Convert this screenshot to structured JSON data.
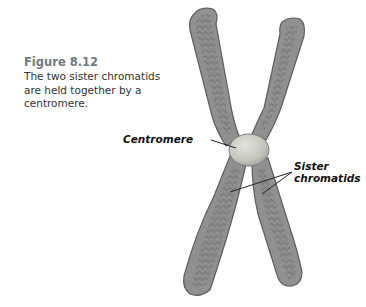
{
  "figure": {
    "number": "Figure 8.12",
    "caption_lines": [
      "The two sister chromatids",
      "are held together by a",
      "centromere."
    ]
  },
  "labels": {
    "centromere": "Centromere",
    "sister_line1": "Sister",
    "sister_line2": "chromatids"
  },
  "colors": {
    "chromatid_fill": "#8e8e8e",
    "chromatid_edge": "#5f5f5f",
    "chromatid_texture": "#6e6e6e",
    "centromere_fill": "#c9c9c2",
    "figure_number": "#6f7a80"
  }
}
